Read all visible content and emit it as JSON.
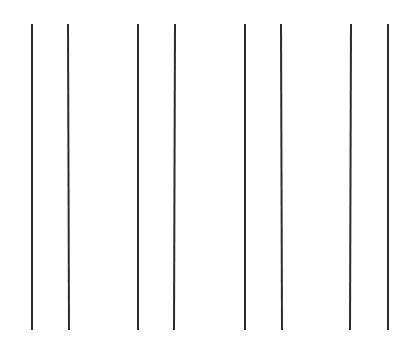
{
  "canvas": {
    "width": 415,
    "height": 342,
    "background_color": "#ffffff",
    "description": "Eight near-vertical dark lines on a plain white background"
  },
  "style": {
    "line_color": "#2b2b2b",
    "line_width_px": 2,
    "line_count": 8
  },
  "chart_data": {
    "type": "line",
    "title": "",
    "subtitle": "",
    "xlabel": "",
    "ylabel": "",
    "grid": false,
    "legend": null,
    "xlim": [
      0,
      415
    ],
    "ylim": [
      0,
      342
    ],
    "orientation": "vertical",
    "series": [
      {
        "name": "line-1",
        "x_top": 31,
        "x_bottom": 31,
        "y_top": 24,
        "y_bottom": 330,
        "length": 306,
        "color": "#2b2b2b",
        "width": 2
      },
      {
        "name": "line-2",
        "x_top": 67,
        "x_bottom": 68,
        "y_top": 24,
        "y_bottom": 330,
        "length": 306,
        "color": "#2b2b2b",
        "width": 2
      },
      {
        "name": "line-3",
        "x_top": 137,
        "x_bottom": 137,
        "y_top": 24,
        "y_bottom": 330,
        "length": 306,
        "color": "#2b2b2b",
        "width": 2
      },
      {
        "name": "line-4",
        "x_top": 174,
        "x_bottom": 173,
        "y_top": 24,
        "y_bottom": 330,
        "length": 306,
        "color": "#2b2b2b",
        "width": 2
      },
      {
        "name": "line-5",
        "x_top": 244,
        "x_bottom": 244,
        "y_top": 24,
        "y_bottom": 330,
        "length": 306,
        "color": "#2b2b2b",
        "width": 2
      },
      {
        "name": "line-6",
        "x_top": 280,
        "x_bottom": 281,
        "y_top": 24,
        "y_bottom": 330,
        "length": 306,
        "color": "#2b2b2b",
        "width": 2
      },
      {
        "name": "line-7",
        "x_top": 350,
        "x_bottom": 349,
        "y_top": 24,
        "y_bottom": 330,
        "length": 306,
        "color": "#2b2b2b",
        "width": 2
      },
      {
        "name": "line-8",
        "x_top": 387,
        "x_bottom": 387,
        "y_top": 24,
        "y_bottom": 330,
        "length": 306,
        "color": "#2b2b2b",
        "width": 2
      }
    ],
    "groups": [
      {
        "name": "pair-1",
        "members": [
          "line-1",
          "line-2"
        ],
        "gap_px": 36
      },
      {
        "name": "pair-2",
        "members": [
          "line-3",
          "line-4"
        ],
        "gap_px": 37
      },
      {
        "name": "pair-3",
        "members": [
          "line-5",
          "line-6"
        ],
        "gap_px": 36
      },
      {
        "name": "pair-4",
        "members": [
          "line-7",
          "line-8"
        ],
        "gap_px": 37
      }
    ],
    "group_spacing_px": 70
  }
}
